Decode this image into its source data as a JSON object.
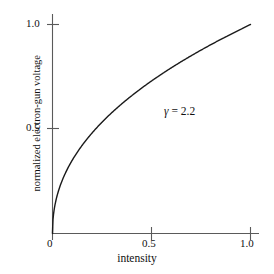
{
  "chart_data": {
    "type": "line",
    "title": "",
    "xlabel": "intensity",
    "ylabel": "normalized electron-gun voltage",
    "xlim": [
      0,
      1.0
    ],
    "ylim": [
      0,
      1.0
    ],
    "xticks": [
      "0",
      "0.5",
      "1.0"
    ],
    "xtick_values": [
      0,
      0.5,
      1.0
    ],
    "yticks": [
      "0.5",
      "1.0"
    ],
    "ytick_values": [
      0.5,
      1.0
    ],
    "grid": false,
    "legend": null,
    "annotations": [
      {
        "name": "gamma-value",
        "symbol": "γ",
        "equals": "=",
        "value": "2.2",
        "text": "γ = 2.2",
        "x": 0.57,
        "y": 0.54
      }
    ],
    "series": [
      {
        "name": "gamma-correction-curve",
        "formula": "v = i^(1/2.2)",
        "gamma": 2.2,
        "color": "#1a1a1a",
        "linewidth": 1.4,
        "x": [
          0.0,
          0.005,
          0.01,
          0.02,
          0.03,
          0.04,
          0.05,
          0.06,
          0.08,
          0.1,
          0.125,
          0.15,
          0.175,
          0.2,
          0.25,
          0.3,
          0.35,
          0.4,
          0.45,
          0.5,
          0.55,
          0.6,
          0.65,
          0.7,
          0.75,
          0.8,
          0.85,
          0.9,
          0.95,
          1.0
        ],
        "y": [
          0.0,
          0.112,
          0.153,
          0.209,
          0.251,
          0.285,
          0.315,
          0.341,
          0.386,
          0.425,
          0.467,
          0.504,
          0.537,
          0.566,
          0.618,
          0.663,
          0.702,
          0.738,
          0.771,
          0.801,
          0.829,
          0.855,
          0.88,
          0.904,
          0.926,
          0.947,
          0.967,
          0.987,
          1.006,
          1.0
        ]
      }
    ]
  },
  "axes": {
    "x_axis_name": "intensity-axis",
    "y_axis_name": "normalized-electron-gun-voltage-axis",
    "spine_color": "#4a4a4a",
    "tick_color": "#4a4a4a"
  },
  "figure": {
    "background": "#ffffff",
    "foreground": "#111111"
  }
}
